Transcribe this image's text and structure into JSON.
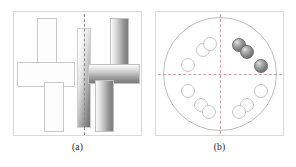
{
  "figure": {
    "width": 296,
    "height": 167,
    "background": "#ffffff"
  },
  "panels": [
    {
      "id": "a",
      "caption": "(a)",
      "description": "Cross-shaped block assembly split by a vertical dashed plane; unshaded wireframe cross on the left, shaded gradient cross on the right, tall shaded slab on the split plane.",
      "border_color": "#d9d9d9",
      "split_line": {
        "orientation": "vertical",
        "style": "dashed",
        "color": "#8a8a8a"
      },
      "shapes": [
        {
          "name": "left-cross-upper-arm",
          "style": "outline",
          "x": 23,
          "y": 6,
          "w": 20,
          "h": 50
        },
        {
          "name": "left-cross-horizontal",
          "style": "outline",
          "x": 3,
          "y": 50,
          "w": 58,
          "h": 25
        },
        {
          "name": "left-cross-lower-arm",
          "style": "outline",
          "x": 30,
          "y": 70,
          "w": 20,
          "h": 50
        },
        {
          "name": "centre-slab",
          "style": "gradient-vertical",
          "x": 63,
          "y": 16,
          "w": 14,
          "h": 100
        },
        {
          "name": "right-cross-upper-arm",
          "style": "gradient-vertical",
          "x": 96,
          "y": 6,
          "w": 19,
          "h": 50
        },
        {
          "name": "right-cross-horizontal",
          "style": "gradient-horizontal",
          "x": 74,
          "y": 52,
          "w": 52,
          "h": 20
        },
        {
          "name": "right-cross-lower-arm",
          "style": "gradient-vertical",
          "x": 81,
          "y": 68,
          "w": 19,
          "h": 52
        }
      ]
    },
    {
      "id": "b",
      "caption": "(b)",
      "description": "Circular arrangement of twelve spheres divided into four quadrants by dashed crosshair axes; the three spheres in the upper-right quadrant are shaded dark, the remaining nine are unshaded.",
      "border_color": "#d9d9d9",
      "circle": {
        "cx": 64,
        "cy": 62,
        "r": 57,
        "color": "#bdbdbd"
      },
      "axes": {
        "style": "dashed",
        "color": "#cfa3a3",
        "horizontal_y": 62,
        "vertical_x": 64
      },
      "sphere_count_total": 12,
      "sphere_count_per_quadrant": 3,
      "highlighted_quadrant": "top-right",
      "highlighted_count": 3,
      "spheres": [
        {
          "name": "sphere-tl-1",
          "quadrant": "top-left",
          "shade": "light",
          "x": 25,
          "y": 46,
          "d": 14
        },
        {
          "name": "sphere-tl-2",
          "quadrant": "top-left",
          "shade": "light",
          "x": 40,
          "y": 31,
          "d": 14
        },
        {
          "name": "sphere-tl-3",
          "quadrant": "top-left",
          "shade": "light",
          "x": 47,
          "y": 25,
          "d": 14
        },
        {
          "name": "sphere-tr-1",
          "quadrant": "top-right",
          "shade": "dark",
          "x": 76,
          "y": 26,
          "d": 14
        },
        {
          "name": "sphere-tr-2",
          "quadrant": "top-right",
          "shade": "dark",
          "x": 84,
          "y": 33,
          "d": 14
        },
        {
          "name": "sphere-tr-3",
          "quadrant": "top-right",
          "shade": "dark",
          "x": 98,
          "y": 47,
          "d": 14
        },
        {
          "name": "sphere-bl-1",
          "quadrant": "bottom-left",
          "shade": "light",
          "x": 25,
          "y": 72,
          "d": 14
        },
        {
          "name": "sphere-bl-2",
          "quadrant": "bottom-left",
          "shade": "light",
          "x": 38,
          "y": 86,
          "d": 14
        },
        {
          "name": "sphere-bl-3",
          "quadrant": "bottom-left",
          "shade": "light",
          "x": 46,
          "y": 93,
          "d": 14
        },
        {
          "name": "sphere-br-1",
          "quadrant": "bottom-right",
          "shade": "light",
          "x": 98,
          "y": 72,
          "d": 14
        },
        {
          "name": "sphere-br-2",
          "quadrant": "bottom-right",
          "shade": "light",
          "x": 84,
          "y": 86,
          "d": 14
        },
        {
          "name": "sphere-br-3",
          "quadrant": "bottom-right",
          "shade": "light",
          "x": 76,
          "y": 93,
          "d": 14
        }
      ]
    }
  ]
}
